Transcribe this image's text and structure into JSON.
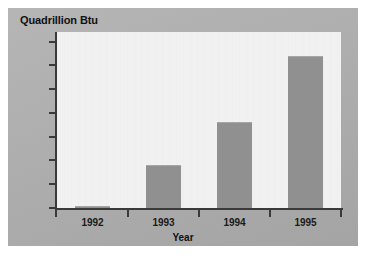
{
  "chart_data": {
    "type": "bar",
    "title": "Quadrillion Btu",
    "xlabel": "Year",
    "ylabel": "",
    "categories": [
      "1992",
      "1993",
      "1994",
      "1995"
    ],
    "values": [
      82.1,
      83.8,
      85.6,
      88.4
    ],
    "ylim": [
      82,
      89.4
    ],
    "yticks": [
      82,
      83,
      84,
      85,
      86,
      87,
      88,
      89
    ],
    "ytick_labels": [
      "82",
      "83",
      "84",
      "85",
      "86",
      "87",
      "88",
      "89"
    ],
    "grid": false,
    "legend": null,
    "series": [
      {
        "name": "Quadrillion Btu",
        "values": [
          82.1,
          83.8,
          85.6,
          88.4
        ]
      }
    ],
    "colors": {
      "bar_fill": "#909090",
      "plot_background": "#f1f1f1",
      "panel_background": "#adadad",
      "axis": "#3a3a3a",
      "text": "#111111",
      "page_background": "#ffffff"
    }
  }
}
